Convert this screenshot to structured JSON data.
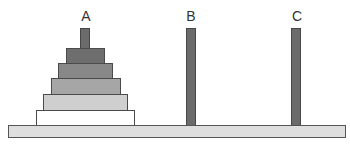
{
  "diagram": {
    "pegs": [
      {
        "id": "A",
        "label": "A",
        "center_x": 85
      },
      {
        "id": "B",
        "label": "B",
        "center_x": 190
      },
      {
        "id": "C",
        "label": "C",
        "center_x": 296
      }
    ],
    "discs_on_A": [
      {
        "size": 1,
        "left": 66,
        "top": 48,
        "width": 39,
        "height": 16,
        "color": "#6e6e6e"
      },
      {
        "size": 2,
        "left": 58,
        "top": 63,
        "width": 55,
        "height": 16,
        "color": "#888888"
      },
      {
        "size": 3,
        "left": 51,
        "top": 78,
        "width": 70,
        "height": 17,
        "color": "#a6a6a6"
      },
      {
        "size": 4,
        "left": 43,
        "top": 94,
        "width": 85,
        "height": 17,
        "color": "#cfcfcf"
      },
      {
        "size": 5,
        "left": 36,
        "top": 110,
        "width": 99,
        "height": 16,
        "color": "#ffffff"
      }
    ],
    "base": {
      "color": "#dedede"
    },
    "peg_color": "#6b6b6b"
  }
}
